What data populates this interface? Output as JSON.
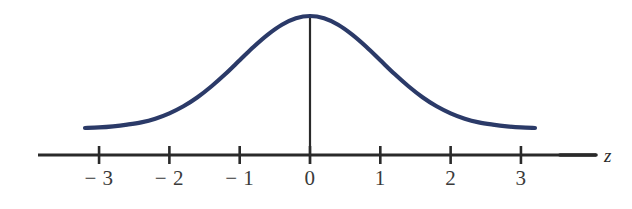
{
  "figure": {
    "background_color": "#ffffff",
    "width": 632,
    "height": 209
  },
  "axis": {
    "variable_label": "z",
    "line_color": "#2a2a2a",
    "tick_labels": [
      "− 3",
      "− 2",
      "− 1",
      "0",
      "1",
      "2",
      "3"
    ]
  },
  "curve": {
    "color": "#2b3a68",
    "vertical_line_color": "#2a2a2a"
  },
  "chart_data": {
    "type": "line",
    "title": "",
    "xlabel": "z",
    "ylabel": "",
    "xlim": [
      -3.5,
      3.5
    ],
    "ylim": [
      0,
      0.42
    ],
    "grid": false,
    "legend_position": "none",
    "xticks": [
      -3,
      -2,
      -1,
      0,
      1,
      2,
      3
    ],
    "xticklabels": [
      "− 3",
      "− 2",
      "− 1",
      "0",
      "1",
      "2",
      "3"
    ],
    "yticks": [],
    "series": [
      {
        "name": "standard normal density",
        "color": "#2b3a68",
        "x": [
          -3.2,
          -3.0,
          -2.8,
          -2.6,
          -2.4,
          -2.2,
          -2.0,
          -1.8,
          -1.6,
          -1.4,
          -1.2,
          -1.0,
          -0.8,
          -0.6,
          -0.4,
          -0.2,
          0.0,
          0.2,
          0.4,
          0.6,
          0.8,
          1.0,
          1.2,
          1.4,
          1.6,
          1.8,
          2.0,
          2.2,
          2.4,
          2.6,
          2.8,
          3.0,
          3.2
        ],
        "y": [
          0.002,
          0.004,
          0.008,
          0.014,
          0.022,
          0.035,
          0.054,
          0.079,
          0.111,
          0.15,
          0.194,
          0.242,
          0.29,
          0.333,
          0.368,
          0.391,
          0.399,
          0.391,
          0.368,
          0.333,
          0.29,
          0.242,
          0.194,
          0.15,
          0.111,
          0.079,
          0.054,
          0.035,
          0.022,
          0.014,
          0.008,
          0.004,
          0.002
        ]
      }
    ],
    "annotations": [
      {
        "name": "center-vertical-line",
        "x": 0,
        "y_from": 0,
        "y_to": 0.399
      }
    ]
  }
}
